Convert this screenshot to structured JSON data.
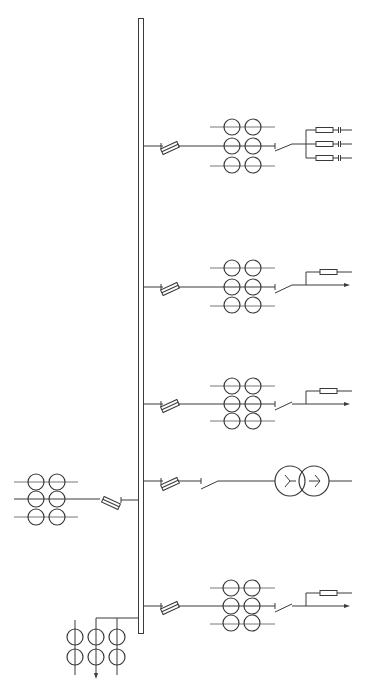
{
  "diagram": {
    "type": "single-line electrical diagram",
    "colors": {
      "line": "#3a3a3a",
      "background": "#ffffff"
    },
    "busbar": {
      "x": 138,
      "y_top": 18,
      "y_bottom": 633,
      "width": 6
    },
    "incomer": {
      "y": 499,
      "components": [
        "current-transformer-stack-2x3",
        "fuse"
      ],
      "ct_center_x": [
        36,
        57
      ]
    },
    "feeders": [
      {
        "id": "feeder-1",
        "y": 146,
        "components": [
          "fuse",
          "current-transformer-stack-2x3",
          "switch",
          "resistor-with-capacitor-x3"
        ]
      },
      {
        "id": "feeder-2",
        "y": 287,
        "components": [
          "fuse",
          "current-transformer-stack-2x3",
          "switch",
          "resistor",
          "outgoing-arrow"
        ]
      },
      {
        "id": "feeder-3",
        "y": 404,
        "components": [
          "fuse",
          "current-transformer-stack-2x3",
          "switch",
          "resistor",
          "outgoing-arrow"
        ]
      },
      {
        "id": "feeder-4",
        "y": 483,
        "components": [
          "fuse",
          "switch",
          "two-winding-transformer-wye-wye"
        ]
      },
      {
        "id": "feeder-5",
        "y": 604,
        "components": [
          "fuse",
          "current-transformer-stack-2x3",
          "switch",
          "resistor",
          "outgoing-arrow"
        ]
      }
    ],
    "bottom_tap": {
      "y": 615,
      "components": [
        "current-transformer-stack-3x2",
        "outgoing-arrow"
      ],
      "columns_x": [
        75,
        96,
        117
      ]
    }
  }
}
